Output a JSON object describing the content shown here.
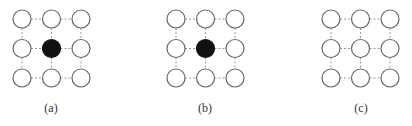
{
  "figure": {
    "panels": [
      {
        "id": "a",
        "label": "(a)",
        "origin_x": 22,
        "label_x": 51,
        "filled": [
          [
            1,
            1
          ]
        ]
      },
      {
        "id": "b",
        "label": "(b)",
        "origin_x": 176,
        "label_x": 205,
        "filled": [
          [
            1,
            1
          ]
        ]
      },
      {
        "id": "c",
        "label": "(c)",
        "origin_x": 331,
        "label_x": 361,
        "filled": []
      }
    ],
    "grid": {
      "rows": 3,
      "cols": 3,
      "spacing": 29.5,
      "origin_y": 19,
      "radius": 9
    },
    "colors": {
      "node_stroke": "#666666",
      "node_fill": "#ffffff",
      "filled_node": "#111111",
      "edge": "#999999"
    }
  }
}
